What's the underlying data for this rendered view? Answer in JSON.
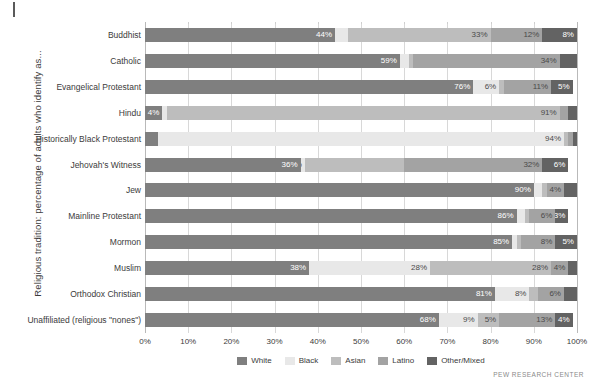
{
  "source_note": "PEW RESEARCH CENTER",
  "chart_data": {
    "type": "bar",
    "subtype": "stacked-horizontal-100",
    "title": "",
    "xlabel": "",
    "ylabel": "Religious tradition: percentage of adults who identify as...",
    "xlim": [
      0,
      100
    ],
    "xticks": [
      "0%",
      "10%",
      "20%",
      "30%",
      "40%",
      "50%",
      "60%",
      "70%",
      "80%",
      "90%",
      "100%"
    ],
    "grid": true,
    "legend_position": "bottom-center",
    "legend": [
      "White",
      "Black",
      "Asian",
      "Latino",
      "Other/Mixed"
    ],
    "colors": {
      "White": "#7f7f7f",
      "Black": "#e8e8e8",
      "Asian": "#bdbdbd",
      "Latino": "#a3a3a3",
      "Other/Mixed": "#636363"
    },
    "categories": [
      "Buddhist",
      "Catholic",
      "Evangelical Protestant",
      "Hindu",
      "Historically Black Protestant",
      "Jehovah's Witness",
      "Jew",
      "Mainline Protestant",
      "Mormon",
      "Muslim",
      "Orthodox Christian",
      "Unaffiliated (religious \"nones\")"
    ],
    "series": [
      {
        "name": "White",
        "values": [
          44,
          59,
          76,
          4,
          3,
          36,
          90,
          86,
          85,
          38,
          81,
          68
        ]
      },
      {
        "name": "Black",
        "values": [
          3,
          2,
          6,
          1,
          94,
          1,
          2,
          2,
          1,
          28,
          8,
          9
        ]
      },
      {
        "name": "Asian",
        "values": [
          33,
          1,
          1,
          91,
          1,
          23,
          1,
          1,
          1,
          28,
          2,
          5
        ]
      },
      {
        "name": "Latino",
        "values": [
          12,
          34,
          11,
          2,
          1,
          32,
          4,
          6,
          8,
          4,
          6,
          13
        ]
      },
      {
        "name": "Other/Mixed",
        "values": [
          8,
          4,
          5,
          2,
          1,
          6,
          3,
          3,
          5,
          2,
          3,
          4
        ]
      }
    ],
    "data_labels": [
      {
        "category": "Buddhist",
        "labels": {
          "White": "44%",
          "Black": "",
          "Asian": "33%",
          "Latino": "12%",
          "Other/Mixed": "8%"
        }
      },
      {
        "category": "Catholic",
        "labels": {
          "White": "59%",
          "Black": "",
          "Asian": "",
          "Latino": "34%",
          "Other/Mixed": ""
        }
      },
      {
        "category": "Evangelical Protestant",
        "labels": {
          "White": "76%",
          "Black": "6%",
          "Asian": "",
          "Latino": "11%",
          "Other/Mixed": "5%"
        }
      },
      {
        "category": "Hindu",
        "labels": {
          "White": "4%",
          "Black": "",
          "Asian": "91%",
          "Latino": "",
          "Other/Mixed": ""
        }
      },
      {
        "category": "Historically Black Protestant",
        "labels": {
          "White": "",
          "Black": "94%",
          "Asian": "",
          "Latino": "",
          "Other/Mixed": ""
        }
      },
      {
        "category": "Jehovah's Witness",
        "labels": {
          "White": "36%",
          "Black": "27%",
          "Asian": "",
          "Latino": "32%",
          "Other/Mixed": "6%"
        }
      },
      {
        "category": "Jew",
        "labels": {
          "White": "90%",
          "Black": "",
          "Asian": "",
          "Latino": "4%",
          "Other/Mixed": ""
        }
      },
      {
        "category": "Mainline Protestant",
        "labels": {
          "White": "86%",
          "Black": "",
          "Asian": "",
          "Latino": "6%",
          "Other/Mixed": "3%"
        }
      },
      {
        "category": "Mormon",
        "labels": {
          "White": "85%",
          "Black": "",
          "Asian": "",
          "Latino": "8%",
          "Other/Mixed": "5%"
        }
      },
      {
        "category": "Muslim",
        "labels": {
          "White": "38%",
          "Black": "28%",
          "Asian": "28%",
          "Latino": "4%",
          "Other/Mixed": ""
        }
      },
      {
        "category": "Orthodox Christian",
        "labels": {
          "White": "81%",
          "Black": "8%",
          "Asian": "",
          "Latino": "6%",
          "Other/Mixed": ""
        }
      },
      {
        "category": "Unaffiliated (religious \"nones\")",
        "labels": {
          "White": "68%",
          "Black": "9%",
          "Asian": "5%",
          "Latino": "13%",
          "Other/Mixed": "4%"
        }
      }
    ]
  }
}
